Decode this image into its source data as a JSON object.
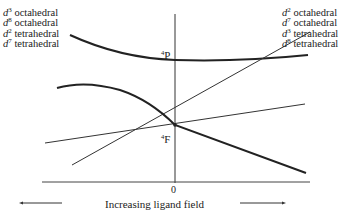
{
  "diagram": {
    "type": "orgel-diagram",
    "left_labels": [
      {
        "d": "d",
        "n": "3",
        "geometry": "octahedral"
      },
      {
        "d": "d",
        "n": "8",
        "geometry": "octahedral"
      },
      {
        "d": "d",
        "n": "2",
        "geometry": "tetrahedral"
      },
      {
        "d": "d",
        "n": "7",
        "geometry": "tetrahedral"
      }
    ],
    "right_labels": [
      {
        "d": "d",
        "n": "2",
        "geometry": "octahedral"
      },
      {
        "d": "d",
        "n": "7",
        "geometry": "octahedral"
      },
      {
        "d": "d",
        "n": "3",
        "geometry": "tetrahedral"
      },
      {
        "d": "d",
        "n": "8",
        "geometry": "tetrahedral"
      }
    ],
    "terms": {
      "P": {
        "multiplicity": "4",
        "letter": "P"
      },
      "F": {
        "multiplicity": "4",
        "letter": "F"
      }
    },
    "origin_label": "0",
    "x_axis_caption": "Increasing ligand field",
    "colors": {
      "line": "#222222",
      "background": "#ffffff"
    }
  }
}
